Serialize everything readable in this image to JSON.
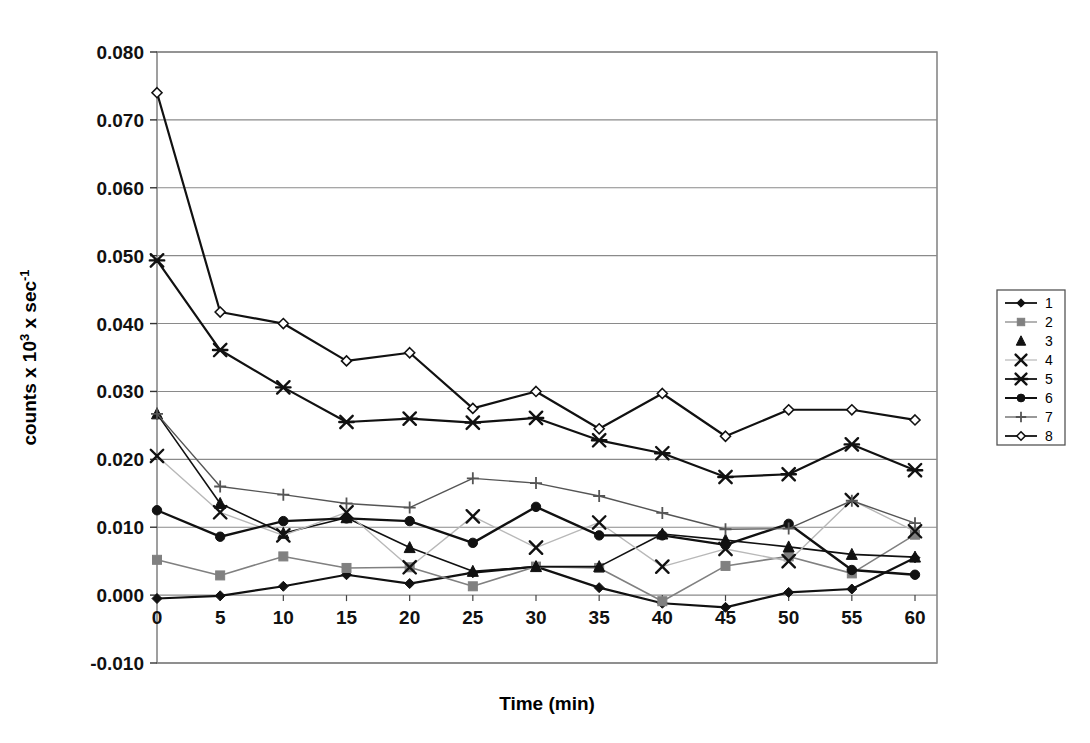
{
  "chart_data": {
    "type": "line",
    "title": "",
    "xlabel": "Time (min)",
    "ylabel": "counts x 10³ x sec⁻¹",
    "ylabel_parts": {
      "prefix": "counts x 10",
      "sup1": "3",
      "mid": " x sec",
      "sup2": "-1"
    },
    "x": [
      0,
      5,
      10,
      15,
      20,
      25,
      30,
      35,
      40,
      45,
      50,
      55,
      60
    ],
    "xtick_labels": [
      "0",
      "5",
      "10",
      "15",
      "20",
      "25",
      "30",
      "35",
      "40",
      "45",
      "50",
      "55",
      "60"
    ],
    "ytick_labels": [
      "0.080",
      "0.070",
      "0.060",
      "0.050",
      "0.040",
      "0.030",
      "0.020",
      "0.010",
      "0.000",
      "-0.010"
    ],
    "ytick_values": [
      0.08,
      0.07,
      0.06,
      0.05,
      0.04,
      0.03,
      0.02,
      0.01,
      0.0,
      -0.01
    ],
    "xlim": [
      0,
      60
    ],
    "ylim": [
      -0.01,
      0.08
    ],
    "grid": "horizontal",
    "legend_position": "right-outside",
    "legend_border": "#555555",
    "series": [
      {
        "name": "1",
        "marker": "diamond",
        "color": "#111111",
        "line_width": 2.2,
        "values": [
          -0.0005,
          -0.0001,
          0.0013,
          0.003,
          0.0017,
          0.0033,
          0.0042,
          0.0011,
          -0.0012,
          -0.0018,
          0.0004,
          0.0009,
          0.0055
        ]
      },
      {
        "name": "2",
        "marker": "square",
        "color": "#808080",
        "line_width": 1.6,
        "values": [
          0.0052,
          0.0029,
          0.0057,
          0.004,
          0.0041,
          0.0013,
          0.0042,
          0.004,
          -0.0009,
          0.0043,
          0.0057,
          0.0032,
          0.0089
        ]
      },
      {
        "name": "3",
        "marker": "triangle",
        "color": "#111111",
        "line_width": 1.6,
        "values": [
          0.0267,
          0.0135,
          0.0091,
          0.0114,
          0.007,
          0.0035,
          0.0042,
          0.0042,
          0.009,
          0.0081,
          0.0071,
          0.006,
          0.0056
        ]
      },
      {
        "name": "4",
        "marker": "x",
        "color": "#b8b8b8",
        "line_width": 1.4,
        "values": [
          0.0205,
          0.0122,
          0.0088,
          0.0122,
          0.0041,
          0.0116,
          0.007,
          0.0107,
          0.0042,
          0.0068,
          0.005,
          0.014,
          0.0094
        ]
      },
      {
        "name": "5",
        "marker": "asterisk",
        "color": "#111111",
        "line_width": 2.2,
        "values": [
          0.0493,
          0.0361,
          0.0306,
          0.0255,
          0.026,
          0.0254,
          0.0261,
          0.0228,
          0.0209,
          0.0174,
          0.0178,
          0.0222,
          0.0184
        ]
      },
      {
        "name": "6",
        "marker": "circle",
        "color": "#111111",
        "line_width": 2.4,
        "values": [
          0.0125,
          0.0086,
          0.0109,
          0.0113,
          0.0109,
          0.0077,
          0.013,
          0.0088,
          0.0088,
          0.0074,
          0.0105,
          0.0037,
          0.003
        ]
      },
      {
        "name": "7",
        "marker": "plus",
        "color": "#555555",
        "line_width": 1.4,
        "values": [
          0.0267,
          0.016,
          0.0148,
          0.0135,
          0.0129,
          0.0172,
          0.0165,
          0.0146,
          0.0121,
          0.0097,
          0.0098,
          0.0139,
          0.0106
        ]
      },
      {
        "name": "8",
        "marker": "open-diamond",
        "color": "#111111",
        "line_width": 2.2,
        "values": [
          0.074,
          0.0417,
          0.04,
          0.0345,
          0.0357,
          0.0275,
          0.03,
          0.0245,
          0.0297,
          0.0234,
          0.0273,
          0.0273,
          0.0258
        ]
      }
    ]
  },
  "plot": {
    "left": 157,
    "right": 937,
    "top": 52,
    "bottom": 663,
    "outer_left": 157,
    "outer_right": 937,
    "frame_color": "#777777",
    "grid_color": "#8a8a8a"
  },
  "legend": {
    "x": 997,
    "y": 290,
    "width": 68,
    "height": 155,
    "items": [
      "1",
      "2",
      "3",
      "4",
      "5",
      "6",
      "7",
      "8"
    ]
  }
}
